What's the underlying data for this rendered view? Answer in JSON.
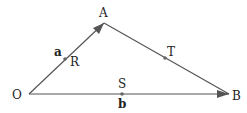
{
  "diagram": {
    "type": "vector-triangle",
    "colors": {
      "line": "#555555",
      "point": "#666666",
      "text": "#222222",
      "background": "#ffffff"
    },
    "points": {
      "O": {
        "label": "O",
        "x": 29,
        "y": 94
      },
      "A": {
        "label": "A",
        "x": 104,
        "y": 23
      },
      "B": {
        "label": "B",
        "x": 229,
        "y": 94
      },
      "R": {
        "label": "R",
        "x": 65,
        "y": 59
      },
      "S": {
        "label": "S",
        "x": 122,
        "y": 94
      },
      "T": {
        "label": "T",
        "x": 165,
        "y": 58
      }
    },
    "vectors": {
      "a": {
        "label": "a",
        "from": "O",
        "to": "A"
      },
      "b": {
        "label": "b",
        "from": "O",
        "to": "B"
      }
    },
    "segments": [
      {
        "from": "O",
        "to": "A",
        "arrow": true
      },
      {
        "from": "A",
        "to": "B",
        "arrow": false
      },
      {
        "from": "O",
        "to": "B",
        "arrow": true
      }
    ]
  }
}
